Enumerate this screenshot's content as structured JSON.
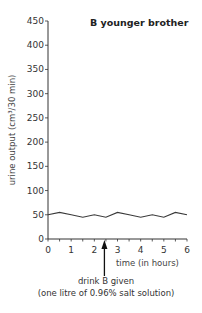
{
  "chart_data": {
    "type": "line",
    "title": "B younger brother",
    "xlabel": "time (in hours)",
    "ylabel": "urine output (cm³/30 min)",
    "xlim": [
      0,
      6
    ],
    "ylim": [
      0,
      450
    ],
    "x_ticks": [
      0,
      1,
      2,
      3,
      4,
      5,
      6
    ],
    "y_ticks": [
      0,
      50,
      100,
      150,
      200,
      250,
      300,
      350,
      400,
      450
    ],
    "minor_x_tick_step": 0.5,
    "grid": false,
    "legend": null,
    "series": [
      {
        "name": "urine output",
        "x": [
          0,
          0.5,
          1,
          1.5,
          2,
          2.5,
          3,
          3.5,
          4,
          4.5,
          5,
          5.5,
          6
        ],
        "values": [
          50,
          55,
          50,
          45,
          50,
          45,
          55,
          50,
          45,
          50,
          45,
          55,
          50
        ]
      }
    ],
    "annotations": [
      {
        "type": "arrow",
        "x": 2.5,
        "label_line1": "drink B given",
        "label_line2": "(one litre of 0.96% salt solution)"
      }
    ]
  },
  "colors": {
    "line": "#3a3a3a",
    "axis": "#333333",
    "text": "#2b2b2b"
  }
}
